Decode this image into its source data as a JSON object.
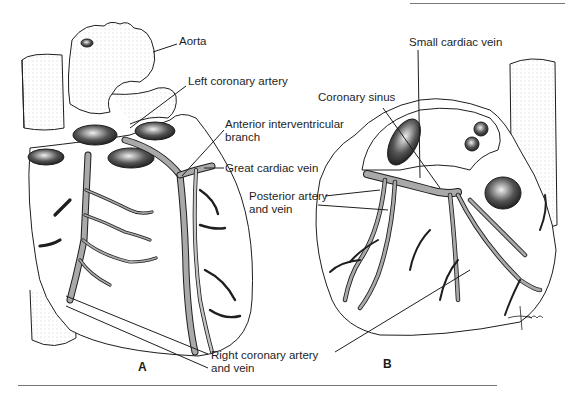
{
  "figure": {
    "panels": [
      {
        "id": "A",
        "letter": "A",
        "view": "anterior heart surface with coronary vessels"
      },
      {
        "id": "B",
        "letter": "B",
        "view": "posterior heart surface with coronary vessels"
      }
    ],
    "labels": {
      "aorta": "Aorta",
      "left_coronary_artery": "Left coronary artery",
      "anterior_interventricular_1": "Anterior interventricular",
      "anterior_interventricular_2": "branch",
      "great_cardiac_vein": "Great cardiac vein",
      "posterior_artery_vein_1": "Posterior artery",
      "posterior_artery_vein_2": "and vein",
      "coronary_sinus": "Coronary sinus",
      "small_cardiac_vein": "Small cardiac vein",
      "right_coronary_1": "Right coronary artery",
      "right_coronary_2": "and vein"
    },
    "artist_signature": "tina",
    "colors": {
      "ink": "#1e1e1e",
      "vessel_fill": "#a9a9a9",
      "rule": "#777777",
      "background": "#ffffff"
    }
  }
}
